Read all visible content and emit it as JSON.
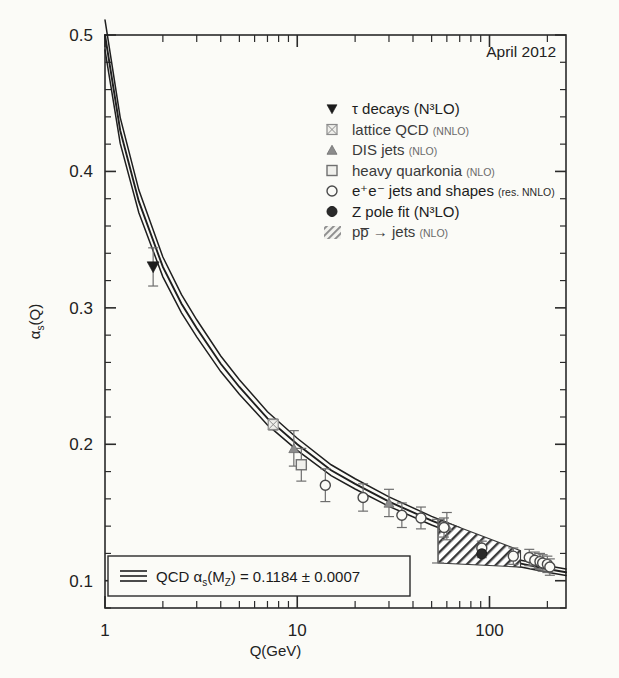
{
  "figure": {
    "date_label": "April 2012",
    "y_axis_label": "αs(Q)",
    "x_axis_label": "Q(GeV)",
    "y_ticks": [
      "0.1",
      "0.2",
      "0.3",
      "0.4",
      "0.5"
    ],
    "x_ticks": [
      "1",
      "10",
      "100"
    ],
    "world_average": {
      "prefix": "QCD ",
      "symbol": "αs(MZ)",
      "equals": " = ",
      "value": "0.1184",
      "pm": " ± ",
      "error": "0.0007",
      "full": "QCD αs(MZ) = 0.1184 ± 0.0007"
    },
    "legend": [
      {
        "marker": "filled-down-triangle",
        "label": "τ decays",
        "order": "(N³LO)",
        "order_inline": true,
        "dark": true
      },
      {
        "marker": "crossed-square",
        "label": "lattice QCD",
        "order": "(NNLO)",
        "dark": false
      },
      {
        "marker": "filled-up-triangle",
        "label": "DIS jets",
        "order": "(NLO)",
        "dark": false
      },
      {
        "marker": "filled-square",
        "label": "heavy quarkonia",
        "order": "(NLO)",
        "dark": false
      },
      {
        "marker": "open-circle",
        "label": "e⁺e⁻ jets and shapes",
        "order": "(res. NNLO)",
        "dark": true
      },
      {
        "marker": "filled-circle",
        "label": "Z pole fit",
        "order": "(N³LO)",
        "order_inline": true,
        "dark": true
      },
      {
        "marker": "hatched-band",
        "label": "pp̅ → jets",
        "order": "(NLO)",
        "dark": false
      }
    ]
  },
  "chart_data": {
    "type": "scatter",
    "title": "",
    "xlabel": "Q(GeV)",
    "ylabel": "αs(Q)",
    "xscale": "log",
    "yscale": "linear",
    "xlim": [
      1,
      250
    ],
    "ylim": [
      0.08,
      0.5
    ],
    "grid": false,
    "legend_position": "top-right",
    "band": {
      "name": "QCD running (world average)",
      "alpha_s_mz": 0.1184,
      "alpha_s_mz_error": 0.0007,
      "curve": [
        {
          "Q": 1.0,
          "as": 0.5
        },
        {
          "Q": 1.2,
          "as": 0.43
        },
        {
          "Q": 1.5,
          "as": 0.378
        },
        {
          "Q": 2.0,
          "as": 0.33
        },
        {
          "Q": 2.5,
          "as": 0.303
        },
        {
          "Q": 3.0,
          "as": 0.285
        },
        {
          "Q": 4.0,
          "as": 0.259
        },
        {
          "Q": 5.0,
          "as": 0.242
        },
        {
          "Q": 7.0,
          "as": 0.219
        },
        {
          "Q": 10.0,
          "as": 0.2
        },
        {
          "Q": 15.0,
          "as": 0.181
        },
        {
          "Q": 20.0,
          "as": 0.171
        },
        {
          "Q": 30.0,
          "as": 0.158
        },
        {
          "Q": 50.0,
          "as": 0.144
        },
        {
          "Q": 70.0,
          "as": 0.136
        },
        {
          "Q": 91.2,
          "as": 0.1184
        },
        {
          "Q": 100.0,
          "as": 0.1172
        },
        {
          "Q": 150.0,
          "as": 0.1122
        },
        {
          "Q": 200.0,
          "as": 0.1086
        },
        {
          "Q": 250.0,
          "as": 0.1062
        }
      ]
    },
    "series": [
      {
        "name": "τ decays (N³LO)",
        "marker": "filled-down-triangle",
        "points": [
          {
            "Q": 1.78,
            "as": 0.33,
            "err_low": 0.014,
            "err_high": 0.014
          }
        ]
      },
      {
        "name": "lattice QCD (NNLO)",
        "marker": "crossed-square",
        "points": [
          {
            "Q": 7.5,
            "as": 0.2145,
            "err_low": 0.004,
            "err_high": 0.004
          }
        ]
      },
      {
        "name": "DIS jets (NLO)",
        "marker": "filled-up-triangle",
        "points": [
          {
            "Q": 9.6,
            "as": 0.197,
            "err_low": 0.013,
            "err_high": 0.013
          },
          {
            "Q": 30.0,
            "as": 0.157,
            "err_low": 0.01,
            "err_high": 0.01
          },
          {
            "Q": 60.0,
            "as": 0.14,
            "err_low": 0.01,
            "err_high": 0.01
          }
        ]
      },
      {
        "name": "heavy quarkonia (NLO)",
        "marker": "filled-square",
        "points": [
          {
            "Q": 10.5,
            "as": 0.185,
            "err_low": 0.012,
            "err_high": 0.012
          }
        ]
      },
      {
        "name": "e⁺e⁻ jets and shapes (res. NNLO)",
        "marker": "open-circle",
        "points": [
          {
            "Q": 14.0,
            "as": 0.17,
            "err_low": 0.012,
            "err_high": 0.012
          },
          {
            "Q": 22.0,
            "as": 0.161,
            "err_low": 0.01,
            "err_high": 0.01
          },
          {
            "Q": 35.0,
            "as": 0.148,
            "err_low": 0.009,
            "err_high": 0.009
          },
          {
            "Q": 44.0,
            "as": 0.146,
            "err_low": 0.008,
            "err_high": 0.008
          },
          {
            "Q": 58.0,
            "as": 0.139,
            "err_low": 0.007,
            "err_high": 0.007
          },
          {
            "Q": 91.2,
            "as": 0.124,
            "err_low": 0.005,
            "err_high": 0.005
          },
          {
            "Q": 133.0,
            "as": 0.118,
            "err_low": 0.006,
            "err_high": 0.006
          },
          {
            "Q": 161.0,
            "as": 0.117,
            "err_low": 0.006,
            "err_high": 0.006
          },
          {
            "Q": 172.0,
            "as": 0.115,
            "err_low": 0.006,
            "err_high": 0.006
          },
          {
            "Q": 183.0,
            "as": 0.114,
            "err_low": 0.006,
            "err_high": 0.006
          },
          {
            "Q": 189.0,
            "as": 0.113,
            "err_low": 0.006,
            "err_high": 0.006
          },
          {
            "Q": 200.0,
            "as": 0.112,
            "err_low": 0.006,
            "err_high": 0.006
          },
          {
            "Q": 206.0,
            "as": 0.11,
            "err_low": 0.006,
            "err_high": 0.006
          }
        ]
      },
      {
        "name": "Z pole fit (N³LO)",
        "marker": "filled-circle",
        "points": [
          {
            "Q": 91.2,
            "as": 0.1197,
            "err_low": 0.0028,
            "err_high": 0.0028
          }
        ]
      },
      {
        "name": "pp̅ → jets (NLO)",
        "marker": "hatched-band",
        "band_x": [
          54,
          145
        ],
        "band_y_top": [
          0.145,
          0.122
        ],
        "band_y_bottom": [
          0.113,
          0.11
        ],
        "points": [
          {
            "Q": 54.0,
            "as": 0.129,
            "err_low": 0.016,
            "err_high": 0.016
          }
        ]
      }
    ]
  }
}
